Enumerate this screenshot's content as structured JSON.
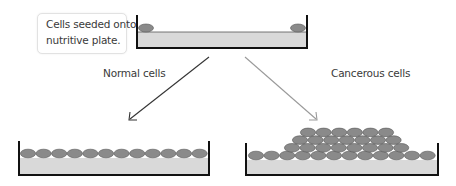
{
  "callout": {
    "line1": "Cells seeded onto",
    "line2": "nutritive plate."
  },
  "labels": {
    "normal": "Normal cells",
    "cancerous": "Cancerous cells"
  },
  "colors": {
    "plate_fill": "#d9d9d9",
    "plate_wall": "#111111",
    "cell_fill": "#8a8a8a",
    "cell_stroke": "#555555",
    "arrow_normal": "#333333",
    "arrow_cancerous": "#9a9a9a",
    "text": "#3a3a3a"
  },
  "diagram": {
    "top_plate": {
      "cells": 2,
      "description": "two sparse cells at plate edges"
    },
    "normal_plate": {
      "cells_per_layer": [
        12
      ],
      "layers": 1,
      "description": "single confluent monolayer (contact inhibition)"
    },
    "cancerous_plate": {
      "cells_per_layer": [
        12,
        8,
        7,
        6
      ],
      "layers": 4,
      "description": "cells pile up in multiple layers (loss of contact inhibition)"
    }
  }
}
